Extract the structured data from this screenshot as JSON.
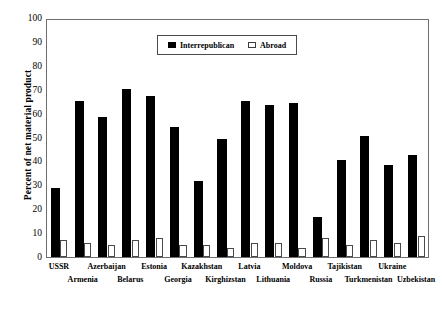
{
  "chart_data": {
    "type": "bar",
    "title": "",
    "subtitle": "",
    "xlabel": "",
    "ylabel": "Percent of net material product",
    "ylim": [
      0,
      100
    ],
    "ytick_values": [
      0,
      10,
      20,
      30,
      40,
      50,
      60,
      70,
      80,
      90,
      100
    ],
    "ytick_labels": [
      "0",
      "10",
      "20",
      "30",
      "40",
      "50",
      "60",
      "70",
      "80",
      "90",
      "100"
    ],
    "grid": false,
    "legend_position": "top-center-inside",
    "categories": [
      "USSR",
      "Armenia",
      "Azerbaijan",
      "Belarus",
      "Estonia",
      "Georgia",
      "Kazakhstan",
      "Kirghizstan",
      "Latvia",
      "Lithuania",
      "Moldova",
      "Russia",
      "Tajikistan",
      "Turkmenistan",
      "Ukraine",
      "Uzbekistan"
    ],
    "series": [
      {
        "name": "Interrepublican",
        "color": "#000000",
        "values": [
          29,
          66,
          59,
          71,
          68,
          55,
          32,
          50,
          66,
          64,
          65,
          17,
          41,
          51,
          39,
          43
        ]
      },
      {
        "name": "Abroad",
        "color": "#ffffff",
        "values": [
          7,
          6,
          5,
          7,
          8,
          5,
          5,
          4,
          6,
          6,
          4,
          8,
          5,
          7,
          6,
          9
        ]
      }
    ]
  },
  "legend": {
    "entries": [
      {
        "label": "Interrepublican",
        "swatch": "filled-square-icon"
      },
      {
        "label": "Abroad",
        "swatch": "open-square-icon"
      }
    ]
  }
}
